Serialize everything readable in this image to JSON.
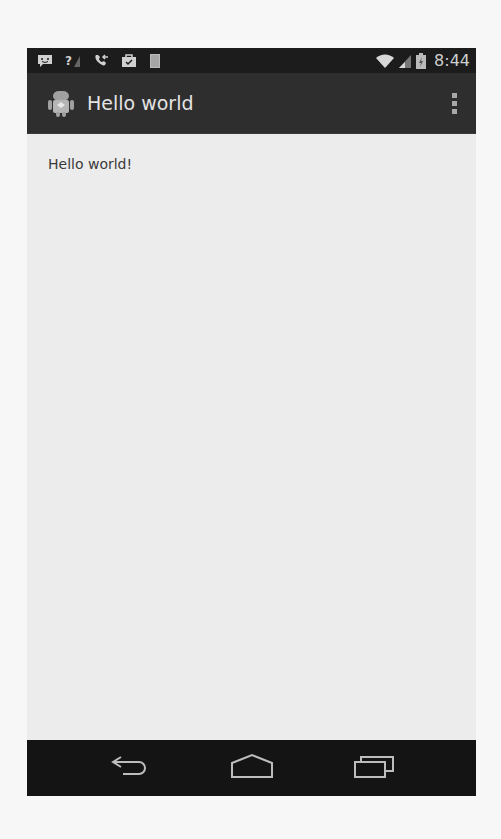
{
  "status_bar": {
    "left_icons": [
      "chat-notification-icon",
      "no-signal-icon",
      "missed-call-icon",
      "briefcase-check-icon",
      "sd-card-icon"
    ],
    "right_icons": [
      "wifi-icon",
      "cell-signal-icon",
      "battery-charging-icon"
    ],
    "time": "8:44"
  },
  "action_bar": {
    "app_icon": "android-icon",
    "title": "Hello world",
    "overflow_icon": "overflow-menu-icon"
  },
  "content": {
    "text": "Hello world!"
  },
  "nav_bar": {
    "buttons": [
      {
        "name": "back",
        "icon": "back-icon"
      },
      {
        "name": "home",
        "icon": "home-icon"
      },
      {
        "name": "recents",
        "icon": "recent-apps-icon"
      }
    ]
  },
  "colors": {
    "status_bar_bg": "#1c1c1c",
    "action_bar_bg": "#2e2e2e",
    "content_bg": "#ececec",
    "nav_bar_bg": "#141414"
  }
}
